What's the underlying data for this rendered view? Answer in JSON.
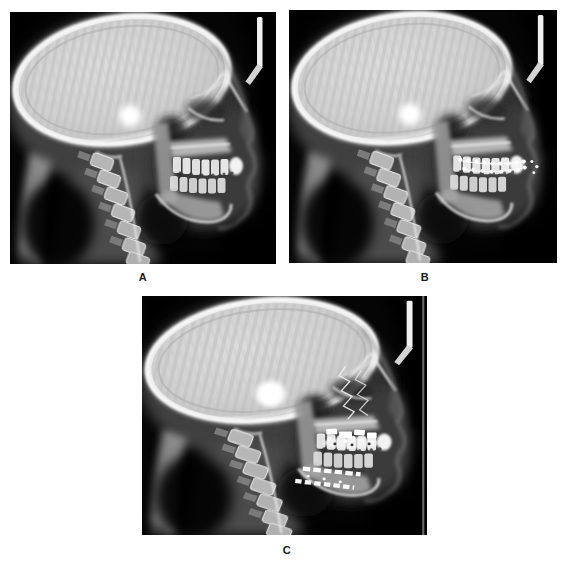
{
  "figure": {
    "type": "three-panel radiograph figure",
    "panels": [
      {
        "label": "A",
        "alt": "Lateral cephalometric skull radiograph"
      },
      {
        "label": "B",
        "alt": "Lateral cephalometric skull radiograph with orthodontic braces on the teeth"
      },
      {
        "label": "C",
        "alt": "Lateral cephalometric skull radiograph with surgical fixation hardware and wires in the jaws"
      }
    ]
  },
  "colors": {
    "page_background": "#ffffff",
    "film_background": "#050505",
    "bone_highlight": "#f5f5f5",
    "label_text": "#1a1a1a"
  }
}
